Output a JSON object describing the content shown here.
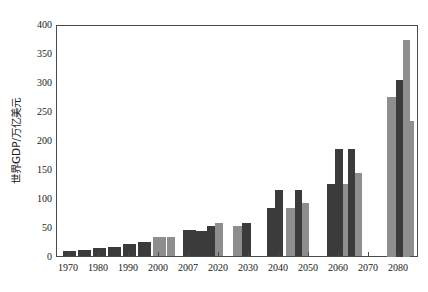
{
  "chart_data": {
    "type": "bar",
    "title": "",
    "xlabel": "",
    "ylabel": "世界GDP/万亿美元",
    "ylim": [
      0,
      400
    ],
    "yticks": [
      0,
      50,
      100,
      150,
      200,
      250,
      300,
      350,
      400
    ],
    "xticks": [
      "1970",
      "1980",
      "1990",
      "2000",
      "2007",
      "2020",
      "2030",
      "2040",
      "2050",
      "2060",
      "2070",
      "2080",
      "2090",
      "2100"
    ],
    "grid": false,
    "legend": "none",
    "colors": {
      "series_a": "#3b3b3b",
      "series_b": "#8e8e8e",
      "axis": "#4a4a4a",
      "background": "#ffffff"
    },
    "series": [
      {
        "name": "series-a",
        "color": "#3b3b3b",
        "points": [
          {
            "x": 1970,
            "value": 9
          },
          {
            "x": 1975,
            "value": 11
          },
          {
            "x": 1980,
            "value": 13
          },
          {
            "x": 1985,
            "value": 16
          },
          {
            "x": 1990,
            "value": 20
          },
          {
            "x": 1995,
            "value": 25
          },
          {
            "x": 2000,
            "value": 30
          },
          {
            "x": 2007,
            "value": 44
          },
          {
            "x": 2020,
            "value": 51
          },
          {
            "x": 2040,
            "value": 82
          },
          {
            "x": 2060,
            "value": 124
          },
          {
            "x": 2080,
            "value": 190
          },
          {
            "x": 2100,
            "value": 278
          }
        ]
      },
      {
        "name": "series-b",
        "color": "#8e8e8e",
        "points": [
          {
            "x": 2000,
            "value": 33
          },
          {
            "x": 2020,
            "value": 57
          },
          {
            "x": 2040,
            "value": 92
          },
          {
            "x": 2060,
            "value": 144
          },
          {
            "x": 2080,
            "value": 232
          },
          {
            "x": 2100,
            "value": 375
          }
        ]
      },
      {
        "name": "series-peak",
        "color": "#3b3b3b",
        "points": [
          {
            "x": 2040,
            "value": 114
          },
          {
            "x": 2060,
            "value": 184
          },
          {
            "x": 2080,
            "value": 261
          },
          {
            "x": 2100,
            "value": 305
          }
        ]
      }
    ]
  }
}
